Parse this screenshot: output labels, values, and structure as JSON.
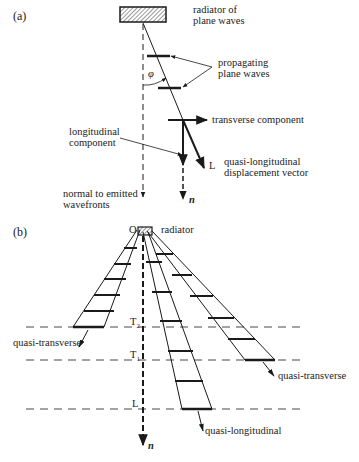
{
  "panel_a": {
    "label": "(a)",
    "radiator": "radiator of",
    "radiator2": "plane waves",
    "propagating": "propagating",
    "propagating2": "plane waves",
    "angle": "φ",
    "transverse": "transverse component",
    "longitudinal": "longitudinal",
    "longitudinal2": "component",
    "L": "L",
    "qlong": "quasi-longitudinal",
    "qlong2": "displacement vector",
    "normal": "normal to emitted",
    "normal2": "wavefronts",
    "n": "n"
  },
  "panel_b": {
    "label": "(b)",
    "O": "O",
    "radiator": "radiator",
    "T2": "T",
    "T2sub": "2",
    "T1": "T",
    "T1sub": "1",
    "L": "L",
    "qt_left": "quasi-transverse",
    "qt_right": "quasi-transverse",
    "ql": "quasi-longitudinal",
    "n": "n"
  },
  "colors": {
    "ink": "#1a1a1a",
    "background": "#ffffff"
  }
}
